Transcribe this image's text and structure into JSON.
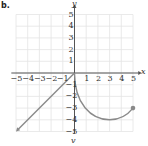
{
  "part_label": "b.",
  "bottom_label": "v",
  "chart_data": {
    "type": "line",
    "title": "",
    "xlabel": "x",
    "ylabel": "y",
    "xlim": [
      -5,
      5
    ],
    "ylim": [
      -5,
      5
    ],
    "grid": true,
    "x_ticks": [
      -5,
      -4,
      -3,
      -2,
      -1,
      1,
      2,
      3,
      4,
      5
    ],
    "y_ticks": [
      5,
      4,
      3,
      2,
      1,
      -1,
      -2,
      -3,
      -4,
      -5
    ],
    "series": [
      {
        "name": "linear piece",
        "description": "y = x for x <= 0, arrow toward lower-left",
        "points": [
          [
            0,
            0
          ],
          [
            -5,
            -5
          ]
        ],
        "end_marker": "arrow"
      },
      {
        "name": "curve piece",
        "description": "curve from origin down to minimum near (3,-4), ending at closed dot (5,-3)",
        "points": [
          [
            0,
            0
          ],
          [
            0.2,
            -1.5
          ],
          [
            1,
            -2.8
          ],
          [
            2,
            -3.7
          ],
          [
            3,
            -4
          ],
          [
            4,
            -3.7
          ],
          [
            5,
            -3
          ]
        ],
        "end_marker": "closed-dot"
      }
    ],
    "colors": {
      "grid": "#e4e4e4",
      "axis": "#555555",
      "series": "#8a8a8a"
    }
  }
}
